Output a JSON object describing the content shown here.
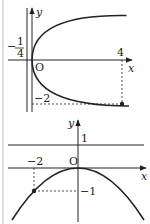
{
  "figure_top": {
    "axis_x_label": "x",
    "axis_y_label": "y",
    "origin_label": "O",
    "directrix_label_num": "1",
    "directrix_label_den": "4",
    "directrix_label_sign": "−",
    "x_tick_label": "4",
    "y_tick_label": "−2",
    "curve": "y^2 = x",
    "point": [
      4,
      -2
    ],
    "directrix": "x = -1/4"
  },
  "figure_bottom": {
    "axis_x_label": "x",
    "axis_y_label": "y",
    "origin_label": "O",
    "line_label": "1",
    "x_tick_label": "−2",
    "y_tick_label": "−1",
    "curve": "y = -x^2/4",
    "point": [
      -2,
      -1
    ],
    "directrix": "y = 1"
  },
  "colors": {
    "ink": "#222222",
    "border": "#bbbbbb"
  }
}
